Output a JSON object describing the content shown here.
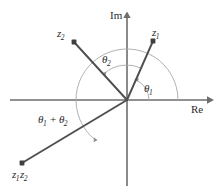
{
  "figure": {
    "type": "complex-plane-vector-diagram",
    "background_color": "#ffffff",
    "stroke_color": "#5a5a5a",
    "vector_color": "#4a4a4a",
    "arc_color": "#9a9a9a",
    "text_color": "#2b2b2b",
    "origin": {
      "x": 127,
      "y": 100
    },
    "axes": {
      "imaginary": {
        "label": "Im",
        "label_x": 110,
        "label_y": 12,
        "x": 127,
        "y_top": 13,
        "y_bottom": 189
      },
      "real": {
        "label": "Re",
        "label_x": 191,
        "label_y": 104,
        "y": 100,
        "x_left": 10,
        "x_right": 212
      }
    },
    "points": [
      {
        "name": "z1",
        "label_main": "z",
        "label_sub": "1",
        "label_x": 152,
        "label_y": 27,
        "marker_x": 153,
        "marker_y": 41,
        "angle_deg": 66,
        "radius": 65
      },
      {
        "name": "z2",
        "label_main": "z",
        "label_sub": "2",
        "label_x": 57,
        "label_y": 28,
        "marker_x": 74,
        "marker_y": 42,
        "angle_deg": 130,
        "radius": 77
      },
      {
        "name": "z1z2",
        "label_main": "z",
        "label_sub": "1",
        "label_main2": "z",
        "label_sub2": "2",
        "label_x": 12,
        "label_y": 169,
        "marker_x": 22,
        "marker_y": 163,
        "angle_deg": 232,
        "radius": 121
      }
    ],
    "angles": [
      {
        "name": "theta1",
        "label_main": "θ",
        "label_sub": "1",
        "label_x": 144,
        "label_y": 83,
        "arc_radius": 22,
        "from_deg": 0,
        "to_deg": 66
      },
      {
        "name": "theta2",
        "label_main": "θ",
        "label_sub": "2",
        "label_x": 102,
        "label_y": 54,
        "arc_radius": 35,
        "from_deg": 66,
        "to_deg": 130
      },
      {
        "name": "theta1-plus-theta2",
        "label_main": "θ",
        "label_sub": "1",
        "label_op": " + ",
        "label_main2": "θ",
        "label_sub2": "2",
        "label_x": 38,
        "label_y": 114,
        "arc_radius": 51,
        "from_deg": 0,
        "to_deg": 232
      }
    ]
  }
}
